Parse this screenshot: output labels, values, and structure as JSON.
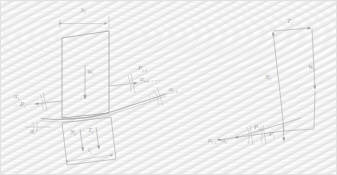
{
  "figure": {
    "background_color": "#f2f2f2",
    "line_color": "#b9b9b9",
    "label_color": "#a9a9a9"
  },
  "left_diagram": {
    "name": "slice-free-body",
    "labels": {
      "width": "b",
      "width_sub": "i",
      "weight": "W",
      "weight_sub": "i",
      "interslice_force_right": "P",
      "interslice_force_right_sub": "i-1",
      "interslice_angle_right": "α",
      "interslice_angle_right_sub": "i-1",
      "base_angle_right": "α",
      "base_angle_right_sub": "i-1",
      "interslice_angle_left": "α",
      "interslice_angle_left_sub": "i",
      "interslice_force_left": "P",
      "interslice_force_left_sub": "i",
      "base_angle_left": "α",
      "base_angle_left_sub": "i",
      "normal_force": "N",
      "normal_force_sub": "i",
      "shear_force": "T",
      "shear_force_sub": "i",
      "base_length": "l",
      "base_length_sub": "i"
    }
  },
  "right_diagram": {
    "name": "force-polygon",
    "labels": {
      "shear_force": "T",
      "shear_force_sub": "i",
      "weight": "W",
      "weight_sub": "i",
      "normal_force": "N",
      "normal_force_sub": "i",
      "interslice_force_upper": "P",
      "interslice_force_upper_sub": "i-1",
      "interslice_force_lower": "P",
      "interslice_force_lower_sub": "i",
      "angle_difference": "α",
      "angle_difference_sub1": "i-1",
      "angle_difference_mid": "−α",
      "angle_difference_sub2": "i"
    }
  }
}
